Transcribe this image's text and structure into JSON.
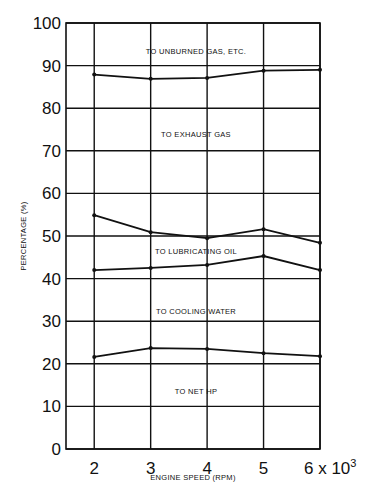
{
  "chart_data": {
    "type": "line",
    "title": "",
    "xlabel": "ENGINE SPEED (RPM)",
    "ylabel": "PERCENTAGE (%)",
    "x": [
      2,
      3,
      4,
      5,
      6
    ],
    "x_tick_labels": [
      "2",
      "3",
      "4",
      "5",
      "6 x 10^3"
    ],
    "x_multiplier": "x 10^3",
    "y_ticks": [
      0,
      10,
      20,
      30,
      40,
      50,
      60,
      70,
      80,
      90,
      100
    ],
    "ylim": [
      0,
      100
    ],
    "xlim": [
      1.5,
      6
    ],
    "grid": true,
    "series": [
      {
        "name": "Net HP / Cooling water boundary",
        "values": [
          21.6,
          23.7,
          23.5,
          22.5,
          21.8
        ]
      },
      {
        "name": "Cooling water / Lubricating oil boundary",
        "values": [
          42.0,
          42.5,
          43.2,
          45.3,
          42.0
        ]
      },
      {
        "name": "Lubricating oil / Exhaust gas boundary",
        "values": [
          54.9,
          50.9,
          49.5,
          51.6,
          48.4
        ]
      },
      {
        "name": "Exhaust gas / Unburned gas boundary",
        "values": [
          87.9,
          86.9,
          87.1,
          88.8,
          89.0
        ]
      }
    ],
    "region_labels": [
      {
        "text": "TO UNBURNED GAS, ETC.",
        "y": 93.5
      },
      {
        "text": "TO EXHAUST GAS",
        "y": 74
      },
      {
        "text": "TO LUBRICATING OIL",
        "y": 46.5
      },
      {
        "text": "TO COOLING WATER",
        "y": 32.5
      },
      {
        "text": "TO NET HP",
        "y": 13.5
      }
    ]
  }
}
